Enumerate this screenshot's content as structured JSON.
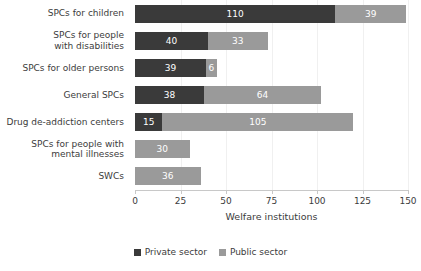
{
  "chart_data": {
    "type": "bar",
    "orientation": "horizontal",
    "stacked": true,
    "title": "",
    "xlabel": "Welfare institutions",
    "ylabel": "",
    "xlim": [
      0,
      150
    ],
    "xticks": [
      0,
      25,
      50,
      75,
      100,
      125,
      150
    ],
    "grid": false,
    "legend_position": "bottom-center",
    "categories": [
      "SPCs for children",
      "SPCs for people\nwith disabilities",
      "SPCs for older persons",
      "General SPCs",
      "Drug de-addiction centers",
      "SPCs for people with\nmental illnesses",
      "SWCs"
    ],
    "series": [
      {
        "name": "Private sector",
        "color": "#3a3a3a",
        "values": [
          110,
          40,
          39,
          38,
          15,
          null,
          null
        ],
        "labels": [
          "110",
          "40",
          "39",
          "38",
          "15",
          "",
          ""
        ]
      },
      {
        "name": "Public sector",
        "color": "#9a9a9a",
        "values": [
          39,
          33,
          6,
          64,
          105,
          30,
          36
        ],
        "labels": [
          "39",
          "33",
          "6",
          "64",
          "105",
          "30",
          "36"
        ]
      }
    ],
    "totals": [
      149,
      73,
      45,
      102,
      120,
      30,
      36
    ]
  }
}
